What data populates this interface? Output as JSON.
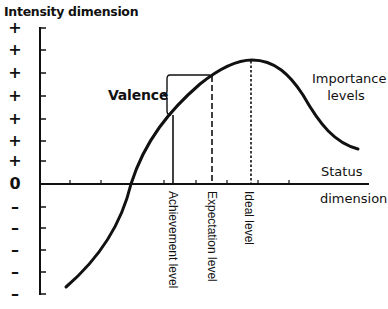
{
  "diagram": {
    "title": "Intensity dimension",
    "y_axis": {
      "positive_tick_labels": [
        "+",
        "+",
        "+",
        "+",
        "+",
        "+",
        "+"
      ],
      "zero_label": "0",
      "negative_tick_labels": [
        "–",
        "–",
        "–",
        "–",
        "–"
      ]
    },
    "x_axis": {
      "label_top": "Status",
      "label_bottom": "dimension"
    },
    "curve_label": {
      "line1": "Importance",
      "line2": "levels"
    },
    "valence_label": "Valence",
    "levels": {
      "achievement": "Achievement level",
      "expectation": "Expectation level",
      "ideal": "Ideal level"
    },
    "colors": {
      "ink": "#111111",
      "background": "#ffffff"
    }
  }
}
